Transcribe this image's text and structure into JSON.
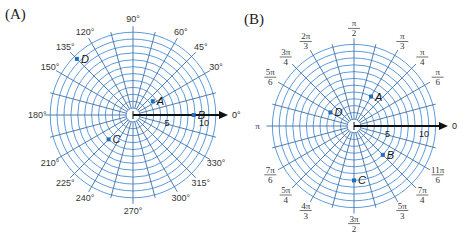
{
  "chart_data": [
    {
      "type": "polar-grid",
      "panel": "(A)",
      "angle_unit": "degrees",
      "rings": 12,
      "radial_ticks": [
        "5",
        "10"
      ],
      "axis_label": "0°",
      "angle_labels": [
        "30°",
        "45°",
        "60°",
        "90°",
        "120°",
        "135°",
        "150°",
        "180°",
        "210°",
        "225°",
        "240°",
        "270°",
        "300°",
        "315°",
        "330°"
      ],
      "points": [
        {
          "name": "A",
          "r": 3.5,
          "theta_deg": 35
        },
        {
          "name": "B",
          "r": 8.8,
          "theta_deg": 0
        },
        {
          "name": "C",
          "r": 5,
          "theta_deg": 225
        },
        {
          "name": "D",
          "r": 11.5,
          "theta_deg": 135
        }
      ]
    },
    {
      "type": "polar-grid",
      "panel": "(B)",
      "angle_unit": "radians",
      "rings": 12,
      "radial_ticks": [
        "5",
        "10"
      ],
      "axis_label": "0",
      "angle_labels": [
        {
          "num": "π",
          "den": "6"
        },
        {
          "num": "π",
          "den": "4"
        },
        {
          "num": "π",
          "den": "3"
        },
        {
          "num": "π",
          "den": "2"
        },
        {
          "num": "2π",
          "den": "3"
        },
        {
          "num": "3π",
          "den": "4"
        },
        {
          "num": "5π",
          "den": "6"
        },
        {
          "num": "π",
          "den": ""
        },
        {
          "num": "7π",
          "den": "6"
        },
        {
          "num": "5π",
          "den": "4"
        },
        {
          "num": "4π",
          "den": "3"
        },
        {
          "num": "3π",
          "den": "2"
        },
        {
          "num": "5π",
          "den": "3"
        },
        {
          "num": "7π",
          "den": "4"
        },
        {
          "num": "11π",
          "den": "6"
        }
      ],
      "points": [
        {
          "name": "A",
          "r": 5,
          "theta_rad": "π/3"
        },
        {
          "name": "B",
          "r": 6,
          "theta_rad": "7π/4"
        },
        {
          "name": "C",
          "r": 8,
          "theta_rad": "3π/2"
        },
        {
          "name": "D",
          "r": 4,
          "theta_rad": "5π/6"
        }
      ]
    }
  ],
  "panels": {
    "a": {
      "label": "(A)"
    },
    "b": {
      "label": "(B)"
    }
  }
}
